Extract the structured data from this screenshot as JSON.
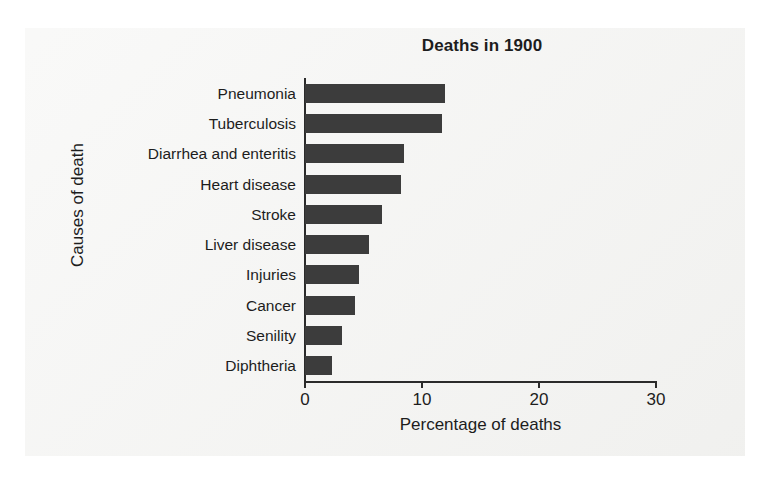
{
  "figure": {
    "background_color": "#f2f2f0",
    "page_color": "#ffffff"
  },
  "chart_data": {
    "type": "bar",
    "orientation": "horizontal",
    "title": "Deaths in 1900",
    "xlabel": "Percentage of deaths",
    "ylabel": "Causes of death",
    "categories": [
      "Pneumonia",
      "Tuberculosis",
      "Diarrhea and enteritis",
      "Heart disease",
      "Stroke",
      "Liver disease",
      "Injuries",
      "Cancer",
      "Senility",
      "Diphtheria"
    ],
    "values": [
      12.0,
      11.7,
      8.5,
      8.2,
      6.6,
      5.5,
      4.6,
      4.3,
      3.2,
      2.3
    ],
    "xlim": [
      0,
      30
    ],
    "xticks": [
      0,
      10,
      20,
      30
    ],
    "xtick_labels": [
      "0",
      "10",
      "20",
      "30"
    ],
    "grid": false,
    "legend": false,
    "bar_color": "#3c3c3c",
    "axis_color": "#2b2b2b",
    "text_color": "#1d1d1d"
  }
}
